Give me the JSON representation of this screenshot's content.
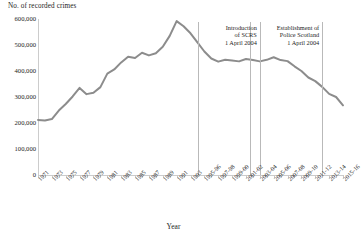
{
  "chart_data": {
    "type": "line",
    "title": "",
    "ylabel": "No. of recorded crimes",
    "xlabel": "Year",
    "ylim": [
      0,
      600000
    ],
    "ytick_labels": [
      "0",
      "100,000",
      "200,000",
      "300,000",
      "400,000",
      "500,000",
      "600,000"
    ],
    "ytick_values": [
      0,
      100000,
      200000,
      300000,
      400000,
      500000,
      600000
    ],
    "grid": false,
    "legend": "none",
    "line_color": "#8c8c8c",
    "axis_color": "#cccccc",
    "annotation_line_color": "#b9b9b9",
    "x": [
      "1971",
      "1972",
      "1973",
      "1974",
      "1975",
      "1976",
      "1977",
      "1978",
      "1979",
      "1980",
      "1981",
      "1982",
      "1983",
      "1984",
      "1985",
      "1986",
      "1987",
      "1988",
      "1989",
      "1990",
      "1991",
      "1992",
      "1993",
      "1994-95",
      "1995-96",
      "1996-97",
      "1997-98",
      "1998-99",
      "1999-00",
      "2000-01",
      "2001-02",
      "2002-03",
      "2003-04",
      "2004-05",
      "2005-06",
      "2006-07",
      "2007-08",
      "2008-09",
      "2009-10",
      "2010-11",
      "2011-12",
      "2012-13",
      "2013-14",
      "2014-15",
      "2015-16"
    ],
    "xtick_labels": [
      "1971",
      "1973",
      "1975",
      "1977",
      "1979",
      "1981",
      "1983",
      "1985",
      "1987",
      "1989",
      "1991",
      "1993",
      "1995-96",
      "1997-98",
      "1999-00",
      "2001-02",
      "2003-04",
      "2005-06",
      "2007-08",
      "2009-10",
      "2011-12",
      "2013-14",
      "2015-16"
    ],
    "values": [
      212000,
      210000,
      215000,
      248000,
      273000,
      302000,
      335000,
      311000,
      316000,
      338000,
      390000,
      406000,
      433000,
      455000,
      450000,
      470000,
      460000,
      468000,
      493000,
      535000,
      592000,
      572000,
      545000,
      510000,
      475000,
      448000,
      436000,
      443000,
      440000,
      437000,
      446000,
      442000,
      437000,
      443000,
      453000,
      442000,
      438000,
      418000,
      400000,
      375000,
      361000,
      339000,
      312000,
      300000,
      268000
    ],
    "annotations": [
      {
        "label_line1": "Introduction",
        "label_line2": "of SCRS",
        "label_line3": "1 April 2004",
        "at_x": "2003-04"
      },
      {
        "label_line1": "Establishment of",
        "label_line2": "Police Scotland",
        "label_line3": "1 April 2004",
        "at_x": "2012-13"
      }
    ]
  }
}
